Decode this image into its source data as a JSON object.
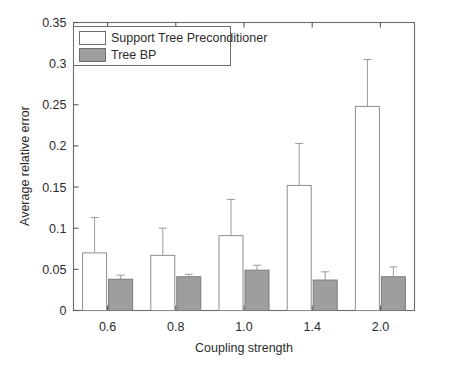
{
  "chart_data": {
    "type": "bar",
    "title": "",
    "subtitle": "",
    "xlabel": "Coupling strength",
    "ylabel": "Average relative error",
    "categories": [
      "0.6",
      "0.8",
      "1.0",
      "1.4",
      "2.0"
    ],
    "ylim": [
      0,
      0.35
    ],
    "yticks": [
      0,
      0.05,
      0.1,
      0.15,
      0.2,
      0.25,
      0.3,
      0.35
    ],
    "ytick_labels": [
      "0",
      "0.05",
      "0.1",
      "0.15",
      "0.2",
      "0.25",
      "0.3",
      "0.35"
    ],
    "grid": false,
    "legend_position": "upper-left",
    "series": [
      {
        "name": "Support Tree Preconditioner",
        "color": "#ffffff",
        "edge_color": "#8e8e8e",
        "values": [
          0.07,
          0.067,
          0.091,
          0.152,
          0.248
        ],
        "error_upper": [
          0.113,
          0.1,
          0.135,
          0.203,
          0.305
        ]
      },
      {
        "name": "Tree BP",
        "color": "#9e9e9e",
        "edge_color": "#7a7a7a",
        "values": [
          0.038,
          0.041,
          0.049,
          0.037,
          0.041
        ],
        "error_upper": [
          0.043,
          0.044,
          0.055,
          0.047,
          0.053
        ]
      }
    ]
  },
  "axes": {
    "x_label": "Coupling strength",
    "y_label": "Average relative error"
  },
  "legend": {
    "items": [
      {
        "label": "Support Tree Preconditioner",
        "swatch": "white"
      },
      {
        "label": "Tree BP",
        "swatch": "gray"
      }
    ]
  },
  "colors": {
    "background": "#ffffff",
    "axis": "#5a5a5a",
    "bar_series_1": "#ffffff",
    "bar_series_2": "#9e9e9e",
    "error_bar": "#9a9a9a",
    "text": "#2b2b2b"
  }
}
